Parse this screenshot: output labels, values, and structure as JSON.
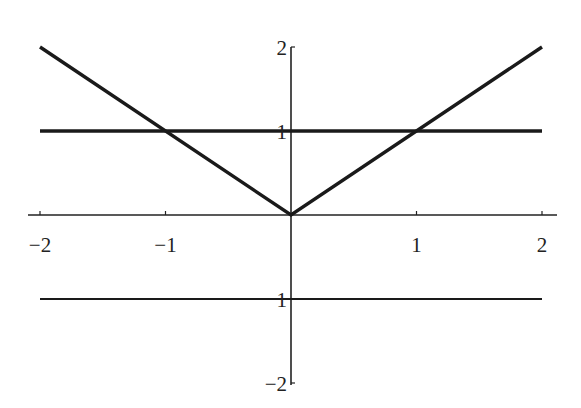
{
  "chart_data": {
    "type": "line",
    "title": "",
    "xlabel": "",
    "ylabel": "",
    "xlim": [
      -2,
      2
    ],
    "ylim": [
      -2,
      2
    ],
    "grid": false,
    "legend": null,
    "x_ticks": [
      -2,
      -1,
      1,
      2
    ],
    "x_tick_labels": [
      "−2",
      "−1",
      "1",
      "2"
    ],
    "y_ticks": [
      -2,
      -1,
      1,
      2
    ],
    "y_tick_labels": [
      "−2",
      "1",
      "1",
      "2"
    ],
    "series": [
      {
        "name": "y = |x|",
        "x": [
          -2,
          0,
          2
        ],
        "y": [
          2,
          0,
          2
        ],
        "style": "thick"
      },
      {
        "name": "y = 1",
        "x": [
          -2,
          2
        ],
        "y": [
          1,
          1
        ],
        "style": "thick"
      },
      {
        "name": "y = -1",
        "x": [
          -2,
          2
        ],
        "y": [
          -1,
          -1
        ],
        "style": "thin"
      }
    ],
    "annotations": []
  },
  "colors": {
    "line": "#1a1a1a",
    "axis": "#222222",
    "background": "#ffffff"
  }
}
